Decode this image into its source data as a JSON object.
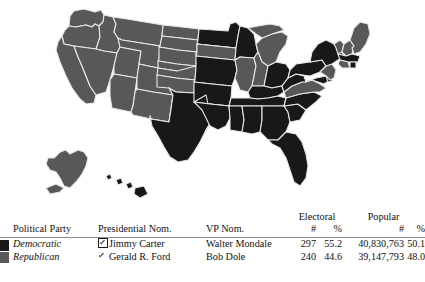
{
  "map": {
    "title": "1976 United States presidential election results map",
    "colors": {
      "democratic": "#181818",
      "republican": "#585858",
      "border": "#e8e8e8",
      "background": "#ffffff"
    },
    "state_results": {
      "AL": "democratic",
      "AK": "republican",
      "AZ": "republican",
      "AR": "democratic",
      "CA": "republican",
      "CO": "republican",
      "CT": "republican",
      "DE": "democratic",
      "DC": "democratic",
      "FL": "democratic",
      "GA": "democratic",
      "HI": "democratic",
      "ID": "republican",
      "IL": "republican",
      "IN": "republican",
      "IA": "republican",
      "KS": "republican",
      "KY": "democratic",
      "LA": "democratic",
      "ME": "republican",
      "MD": "democratic",
      "MA": "democratic",
      "MI": "republican",
      "MN": "democratic",
      "MS": "democratic",
      "MO": "democratic",
      "MT": "republican",
      "NE": "republican",
      "NV": "republican",
      "NH": "republican",
      "NJ": "republican",
      "NM": "republican",
      "NY": "democratic",
      "NC": "democratic",
      "ND": "republican",
      "OH": "democratic",
      "OK": "republican",
      "OR": "republican",
      "PA": "democratic",
      "RI": "democratic",
      "SC": "democratic",
      "SD": "republican",
      "TN": "democratic",
      "TX": "democratic",
      "UT": "republican",
      "VT": "republican",
      "VA": "republican",
      "WA": "republican",
      "WV": "democratic",
      "WI": "democratic",
      "WY": "republican"
    }
  },
  "table": {
    "group_headers": {
      "electoral": "Electoral",
      "popular": "Popular"
    },
    "headers": {
      "party": "Political Party",
      "president": "Presidential Nom.",
      "vp": "VP Nom.",
      "electoral_num": "#",
      "electoral_pct": "%",
      "popular_num": "#",
      "popular_pct": "%"
    },
    "rows": [
      {
        "swatch": "democratic-swatch",
        "party": "Democratic",
        "winner_marker": "checked-checkbox",
        "president": "Jimmy Carter",
        "vp": "Walter Mondale",
        "electoral_num": "297",
        "electoral_pct": "55.2",
        "popular_num": "40,830,763",
        "popular_pct": "50.1"
      },
      {
        "swatch": "republican-swatch",
        "party": "Republican",
        "winner_marker": "unchecked",
        "president": "Gerald R. Ford",
        "vp": "Bob Dole",
        "electoral_num": "240",
        "electoral_pct": "44.6",
        "popular_num": "39,147,793",
        "popular_pct": "48.0"
      }
    ]
  }
}
